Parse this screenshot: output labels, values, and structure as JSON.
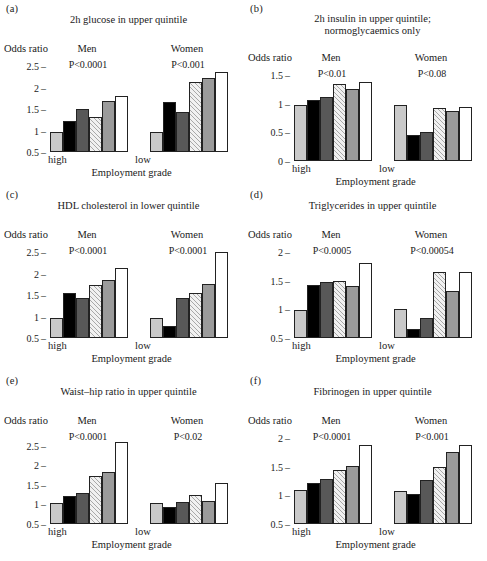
{
  "figure": {
    "x_axis_label": "Employment grade",
    "y_axis_label": "Odds ratio",
    "group_labels": {
      "men": "Men",
      "women": "Women"
    },
    "x_tick_low": "low",
    "x_tick_high": "high",
    "series_names": [
      "grade 1",
      "grade 2",
      "grade 3",
      "grade 4",
      "grade 5",
      "grade 6"
    ],
    "series_styles": [
      "light-grey",
      "black",
      "dark-grey",
      "hatched",
      "mid-grey",
      "white"
    ],
    "colors": {
      "light_grey": "#c9c9c9",
      "black": "#000000",
      "dark_grey": "#585858",
      "hatched": "#f1f1f1",
      "mid_grey": "#9b9b9b",
      "white": "#ffffff",
      "outline": "#222222",
      "text": "#1a1a1a"
    }
  },
  "panels": [
    {
      "letter": "(a)",
      "title": "2h glucose in upper quintile",
      "title_lines": [
        "2h glucose in upper quintile"
      ],
      "p_men": "P<0.0001",
      "p_women": "P<0.001",
      "yticks": [
        "0.5",
        "1",
        "1.5",
        "2",
        "2.5"
      ],
      "ylim": [
        0.5,
        2.5
      ],
      "men": [
        0.97,
        1.23,
        1.5,
        1.32,
        1.68,
        1.8
      ],
      "women": [
        0.97,
        1.67,
        1.42,
        2.13,
        2.22,
        2.35
      ]
    },
    {
      "letter": "(b)",
      "title": "2h insulin in upper quintile; normoglycaemics only",
      "title_lines": [
        "2h insulin in upper quintile;",
        "normoglycaemics only"
      ],
      "p_men": "P<0.01",
      "p_women": "P<0.08",
      "yticks": [
        "0",
        "0.5",
        "1",
        "1.5"
      ],
      "ylim": [
        0,
        1.5
      ],
      "men": [
        0.97,
        1.07,
        1.12,
        1.35,
        1.25,
        1.38
      ],
      "women": [
        0.97,
        0.45,
        0.5,
        0.93,
        0.87,
        0.95
      ]
    },
    {
      "letter": "(c)",
      "title": "HDL cholesterol in lower quintile",
      "title_lines": [
        "HDL cholesterol in lower quintile"
      ],
      "p_men": "P<0.0001",
      "p_women": "P<0.0001",
      "yticks": [
        "0.5",
        "1",
        "1.5",
        "2",
        "2.5"
      ],
      "ylim": [
        0.5,
        2.5
      ],
      "men": [
        0.97,
        1.55,
        1.43,
        1.73,
        1.85,
        2.13
      ],
      "women": [
        0.97,
        0.78,
        1.44,
        1.55,
        1.75,
        2.5
      ]
    },
    {
      "letter": "(d)",
      "title": "Triglycerides in upper quintile",
      "title_lines": [
        "Triglycerides in upper quintile"
      ],
      "p_men": "P<0.0005",
      "p_women": "P<0.00054",
      "yticks": [
        "0.5",
        "1",
        "1.5",
        "2"
      ],
      "ylim": [
        0.5,
        2.0
      ],
      "men": [
        0.98,
        1.42,
        1.48,
        1.5,
        1.41,
        1.8
      ],
      "women": [
        1.0,
        0.65,
        0.85,
        1.65,
        1.32,
        1.65
      ]
    },
    {
      "letter": "(e)",
      "title": "Waist–hip ratio in upper quintile",
      "title_lines": [
        "Waist–hip ratio in upper quintile"
      ],
      "p_men": "P<0.0001",
      "p_women": "P<0.02",
      "yticks": [
        "0.5",
        "1",
        "1.5",
        "2",
        "2.5"
      ],
      "ylim": [
        0.5,
        2.7
      ],
      "men": [
        1.05,
        1.21,
        1.3,
        1.73,
        1.84,
        2.6
      ],
      "women": [
        1.05,
        0.93,
        1.07,
        1.24,
        1.08,
        1.54
      ]
    },
    {
      "letter": "(f)",
      "title": "Fibrinogen in upper quintile",
      "title_lines": [
        "Fibrinogen in upper quintile"
      ],
      "p_men": "P<0.0001",
      "p_women": "P<0.001",
      "yticks": [
        "0.5",
        "1",
        "1.5",
        "2"
      ],
      "ylim": [
        0.5,
        2.0
      ],
      "men": [
        1.09,
        1.22,
        1.28,
        1.45,
        1.52,
        1.87
      ],
      "women": [
        1.08,
        1.03,
        1.26,
        1.49,
        1.75,
        1.87
      ]
    }
  ],
  "chart_data": {
    "type": "bar",
    "xlabel": "Employment grade",
    "ylabel": "Odds ratio",
    "categories": [
      "high",
      "2",
      "3",
      "4",
      "5",
      "low"
    ],
    "grid": false,
    "legend_position": "none",
    "panels": [
      {
        "panel": "(a)",
        "title": "2h glucose in upper quintile",
        "ylim": [
          0.5,
          2.5
        ],
        "yticks": [
          0.5,
          1,
          1.5,
          2,
          2.5
        ],
        "annotations": {
          "Men": "P<0.0001",
          "Women": "P<0.001"
        },
        "series": [
          {
            "name": "Men",
            "values": [
              0.97,
              1.23,
              1.5,
              1.32,
              1.68,
              1.8
            ]
          },
          {
            "name": "Women",
            "values": [
              0.97,
              1.67,
              1.42,
              2.13,
              2.22,
              2.35
            ]
          }
        ]
      },
      {
        "panel": "(b)",
        "title": "2h insulin in upper quintile; normoglycaemics only",
        "ylim": [
          0,
          1.5
        ],
        "yticks": [
          0,
          0.5,
          1,
          1.5
        ],
        "annotations": {
          "Men": "P<0.01",
          "Women": "P<0.08"
        },
        "series": [
          {
            "name": "Men",
            "values": [
              0.97,
              1.07,
              1.12,
              1.35,
              1.25,
              1.38
            ]
          },
          {
            "name": "Women",
            "values": [
              0.97,
              0.45,
              0.5,
              0.93,
              0.87,
              0.95
            ]
          }
        ]
      },
      {
        "panel": "(c)",
        "title": "HDL cholesterol in lower quintile",
        "ylim": [
          0.5,
          2.5
        ],
        "yticks": [
          0.5,
          1,
          1.5,
          2,
          2.5
        ],
        "annotations": {
          "Men": "P<0.0001",
          "Women": "P<0.0001"
        },
        "series": [
          {
            "name": "Men",
            "values": [
              0.97,
              1.55,
              1.43,
              1.73,
              1.85,
              2.13
            ]
          },
          {
            "name": "Women",
            "values": [
              0.97,
              0.78,
              1.44,
              1.55,
              1.75,
              2.5
            ]
          }
        ]
      },
      {
        "panel": "(d)",
        "title": "Triglycerides in upper quintile",
        "ylim": [
          0.5,
          2.0
        ],
        "yticks": [
          0.5,
          1,
          1.5,
          2
        ],
        "annotations": {
          "Men": "P<0.0005",
          "Women": "P<0.00054"
        },
        "series": [
          {
            "name": "Men",
            "values": [
              0.98,
              1.42,
              1.48,
              1.5,
              1.41,
              1.8
            ]
          },
          {
            "name": "Women",
            "values": [
              1.0,
              0.65,
              0.85,
              1.65,
              1.32,
              1.65
            ]
          }
        ]
      },
      {
        "panel": "(e)",
        "title": "Waist–hip ratio in upper quintile",
        "ylim": [
          0.5,
          2.7
        ],
        "yticks": [
          0.5,
          1,
          1.5,
          2,
          2.5
        ],
        "annotations": {
          "Men": "P<0.0001",
          "Women": "P<0.02"
        },
        "series": [
          {
            "name": "Men",
            "values": [
              1.05,
              1.21,
              1.3,
              1.73,
              1.84,
              2.6
            ]
          },
          {
            "name": "Women",
            "values": [
              1.05,
              0.93,
              1.07,
              1.24,
              1.08,
              1.54
            ]
          }
        ]
      },
      {
        "panel": "(f)",
        "title": "Fibrinogen in upper quintile",
        "ylim": [
          0.5,
          2.0
        ],
        "yticks": [
          0.5,
          1,
          1.5,
          2
        ],
        "annotations": {
          "Men": "P<0.0001",
          "Women": "P<0.001"
        },
        "series": [
          {
            "name": "Men",
            "values": [
              1.09,
              1.22,
              1.28,
              1.45,
              1.52,
              1.87
            ]
          },
          {
            "name": "Women",
            "values": [
              1.08,
              1.03,
              1.26,
              1.49,
              1.75,
              1.87
            ]
          }
        ]
      }
    ]
  }
}
